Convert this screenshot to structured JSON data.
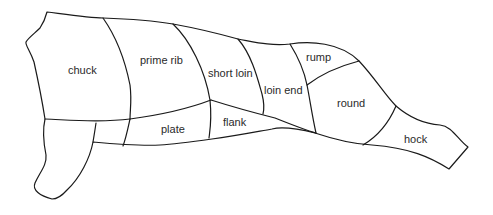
{
  "diagram": {
    "cuts": [
      {
        "id": "chuck",
        "label": "chuck"
      },
      {
        "id": "prime-rib",
        "label": "prime rib"
      },
      {
        "id": "short-loin",
        "label": "short loin"
      },
      {
        "id": "loin-end",
        "label": "loin end"
      },
      {
        "id": "rump",
        "label": "rump"
      },
      {
        "id": "round",
        "label": "round"
      },
      {
        "id": "plate",
        "label": "plate"
      },
      {
        "id": "flank",
        "label": "flank"
      },
      {
        "id": "hock",
        "label": "hock"
      }
    ],
    "colors": {
      "line": "#1a1a1a",
      "text": "#2a2a2a",
      "background": "#ffffff"
    }
  }
}
